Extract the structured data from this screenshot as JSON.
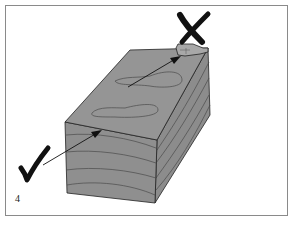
{
  "figure": {
    "number": "4",
    "markers": {
      "correct": {
        "symbol": "check-mark",
        "points_to": "end grain face"
      },
      "incorrect": {
        "symbol": "x-mark",
        "points_to": "top face knot"
      }
    },
    "colors": {
      "border": "#8a8a8a",
      "block_fill": "#8f8f8f",
      "block_top": "#959595",
      "outline": "#222222",
      "grain": "#4a4a4a",
      "marks": "#111111"
    }
  }
}
